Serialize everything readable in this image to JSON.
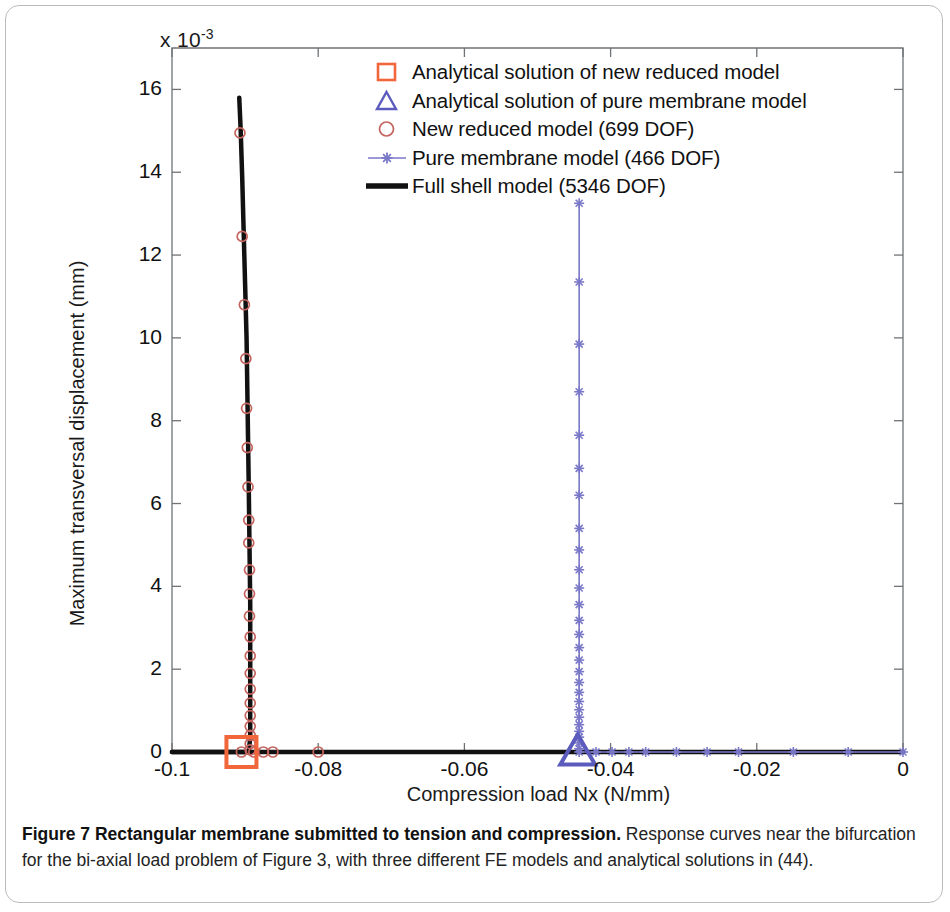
{
  "figure": {
    "exponent_prefix": "x 10",
    "exponent_power": "-3",
    "caption_bold": "Figure 7 Rectangular membrane submitted to tension and compression.",
    "caption_rest": " Response curves near the bifurcation for the bi-axial load problem of Figure 3, with three different FE models and analytical solutions in (44)."
  },
  "legend": {
    "position": "upper-center",
    "items": [
      {
        "marker": "square-marker",
        "label": "Analytical solution of new reduced model",
        "color": "#F2663C"
      },
      {
        "marker": "triangle-marker",
        "label": "Analytical solution of pure membrane model",
        "color": "#5B5BBE"
      },
      {
        "marker": "circle-marker",
        "label": "New reduced model (699 DOF)",
        "color": "#C4645F"
      },
      {
        "marker": "line-star-marker",
        "label": "Pure membrane model (466 DOF)",
        "color": "#7A78C8"
      },
      {
        "marker": "thick-line-marker",
        "label": "Full shell model (5346 DOF)",
        "color": "#111111"
      }
    ]
  },
  "chart_data": {
    "type": "line",
    "title": "",
    "xlabel": "Compression load Nx (N/mm)",
    "ylabel": "Maximum transversal displacement (mm)",
    "y_exponent": -3,
    "xlim": [
      -0.1,
      0
    ],
    "ylim": [
      0,
      17
    ],
    "xticks": [
      -0.1,
      -0.08,
      -0.06,
      -0.04,
      -0.02,
      0
    ],
    "xtick_labels": [
      "-0.1",
      "-0.08",
      "-0.06",
      "-0.04",
      "-0.02",
      "0"
    ],
    "yticks": [
      0,
      2,
      4,
      6,
      8,
      10,
      12,
      14,
      16
    ],
    "ytick_labels": [
      "0",
      "2",
      "4",
      "6",
      "8",
      "10",
      "12",
      "14",
      "16"
    ],
    "grid": false,
    "series": [
      {
        "name": "Full shell model (5346 DOF)",
        "style": "thick-line",
        "color": "#111111",
        "linewidth": 4.5,
        "points": [
          [
            -0.1,
            0
          ],
          [
            -0.0925,
            0
          ],
          [
            -0.0905,
            0
          ],
          [
            -0.0898,
            0
          ],
          [
            -0.0895,
            0
          ],
          [
            -0.0893,
            0.35
          ],
          [
            -0.0893,
            1.2
          ],
          [
            -0.0893,
            2.3
          ],
          [
            -0.0893,
            3.6
          ],
          [
            -0.0894,
            5.0
          ],
          [
            -0.0895,
            6.4
          ],
          [
            -0.0896,
            7.6
          ],
          [
            -0.0897,
            8.8
          ],
          [
            -0.0898,
            10.0
          ],
          [
            -0.09,
            11.3
          ],
          [
            -0.0902,
            12.6
          ],
          [
            -0.0904,
            13.9
          ],
          [
            -0.0906,
            15.0
          ],
          [
            -0.0908,
            15.8
          ]
        ],
        "baseline_points": [
          [
            -0.1,
            0
          ],
          [
            -0.08,
            0
          ],
          [
            -0.06,
            0
          ],
          [
            -0.044,
            0
          ],
          [
            -0.02,
            0
          ],
          [
            0,
            0
          ]
        ]
      },
      {
        "name": "New reduced model (699 DOF)",
        "style": "circle-markers",
        "color": "#C4645F",
        "marker_size": 10,
        "points": [
          [
            -0.0893,
            0.05
          ],
          [
            -0.0893,
            0.2
          ],
          [
            -0.0893,
            0.4
          ],
          [
            -0.0893,
            0.62
          ],
          [
            -0.0893,
            0.88
          ],
          [
            -0.0893,
            1.18
          ],
          [
            -0.0893,
            1.52
          ],
          [
            -0.0893,
            1.9
          ],
          [
            -0.0893,
            2.32
          ],
          [
            -0.0893,
            2.78
          ],
          [
            -0.0894,
            3.28
          ],
          [
            -0.0894,
            3.82
          ],
          [
            -0.0894,
            4.4
          ],
          [
            -0.0895,
            5.05
          ],
          [
            -0.0895,
            5.6
          ],
          [
            -0.0896,
            6.4
          ],
          [
            -0.0897,
            7.35
          ],
          [
            -0.0898,
            8.3
          ],
          [
            -0.0899,
            9.5
          ],
          [
            -0.0901,
            10.8
          ],
          [
            -0.0904,
            12.45
          ],
          [
            -0.0907,
            14.95
          ]
        ],
        "baseline_points": [
          [
            -0.0905,
            0
          ],
          [
            -0.0888,
            0
          ],
          [
            -0.0875,
            0
          ],
          [
            -0.0862,
            0
          ],
          [
            -0.08,
            0
          ]
        ]
      },
      {
        "name": "Pure membrane model (466 DOF)",
        "style": "line-star",
        "color": "#7A78C8",
        "linewidth": 1.6,
        "points": [
          [
            -0.0443,
            0.08
          ],
          [
            -0.0443,
            0.22
          ],
          [
            -0.0443,
            0.36
          ],
          [
            -0.0443,
            0.5
          ],
          [
            -0.0443,
            0.66
          ],
          [
            -0.0443,
            0.84
          ],
          [
            -0.0443,
            1.02
          ],
          [
            -0.0443,
            1.22
          ],
          [
            -0.0443,
            1.44
          ],
          [
            -0.0443,
            1.68
          ],
          [
            -0.0443,
            1.94
          ],
          [
            -0.0443,
            2.22
          ],
          [
            -0.0443,
            2.52
          ],
          [
            -0.0443,
            2.84
          ],
          [
            -0.0443,
            3.18
          ],
          [
            -0.0443,
            3.56
          ],
          [
            -0.0443,
            3.96
          ],
          [
            -0.0443,
            4.4
          ],
          [
            -0.0443,
            4.88
          ],
          [
            -0.0443,
            5.4
          ],
          [
            -0.0443,
            6.2
          ],
          [
            -0.0443,
            6.85
          ],
          [
            -0.0443,
            7.65
          ],
          [
            -0.0443,
            8.7
          ],
          [
            -0.0443,
            9.85
          ],
          [
            -0.0443,
            11.35
          ],
          [
            -0.0443,
            13.25
          ]
        ],
        "baseline_points": [
          [
            -0.0443,
            0
          ],
          [
            -0.042,
            0
          ],
          [
            -0.0398,
            0
          ],
          [
            -0.0375,
            0
          ],
          [
            -0.0352,
            0
          ],
          [
            -0.031,
            0
          ],
          [
            -0.0268,
            0
          ],
          [
            -0.0225,
            0
          ],
          [
            -0.015,
            0
          ],
          [
            -0.0075,
            0
          ],
          [
            0,
            0
          ]
        ]
      },
      {
        "name": "Analytical solution of new reduced model",
        "style": "square-marker",
        "color": "#F2663C",
        "marker_size": 30,
        "points": [
          [
            -0.0905,
            0
          ]
        ]
      },
      {
        "name": "Analytical solution of pure membrane model",
        "style": "triangle-marker",
        "color": "#5B5BBE",
        "marker_size": 30,
        "points": [
          [
            -0.0445,
            0
          ]
        ]
      }
    ]
  }
}
